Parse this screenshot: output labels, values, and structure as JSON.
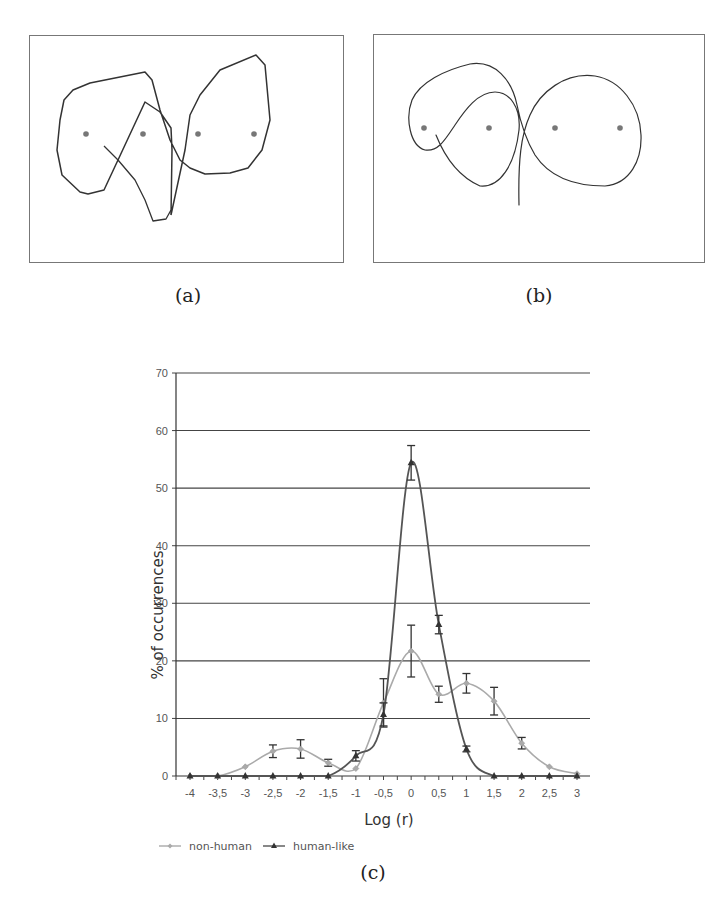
{
  "figure": {
    "panels": [
      {
        "id": "a",
        "caption": "(a)",
        "dots": [
          [
            86,
            134
          ],
          [
            143,
            134
          ],
          [
            198,
            134
          ],
          [
            254,
            134
          ]
        ]
      },
      {
        "id": "b",
        "caption": "(b)",
        "dots": [
          [
            424,
            128
          ],
          [
            489,
            128
          ],
          [
            555,
            128
          ],
          [
            620,
            128
          ]
        ]
      }
    ],
    "chart_caption": "(c)"
  },
  "chart_data": {
    "type": "line",
    "title": "",
    "xlabel": "Log (r)",
    "ylabel": "% of occurrences",
    "x": [
      -4,
      -3.5,
      -3,
      -2.5,
      -2,
      -1.5,
      -1,
      -0.5,
      0,
      0.5,
      1,
      1.5,
      2,
      2.5,
      3
    ],
    "x_tick_labels": [
      "-4",
      "-3,5",
      "-3",
      "-2,5",
      "-2",
      "-1,5",
      "-1",
      "-0,5",
      "0",
      "0,5",
      "1",
      "1,5",
      "2",
      "2,5",
      "3"
    ],
    "y_ticks": [
      0,
      10,
      20,
      30,
      40,
      50,
      60,
      70
    ],
    "ylim": [
      0,
      70
    ],
    "grid": "horizontal",
    "legend_position": "bottom-left",
    "series": [
      {
        "name": "non-human",
        "color": "#aaaaaa",
        "marker": "diamond",
        "values": [
          0,
          0,
          1.6,
          4.3,
          4.7,
          2.3,
          1.3,
          12.7,
          21.7,
          14.2,
          16.1,
          13.0,
          5.7,
          1.6,
          0.4
        ],
        "error": [
          0,
          0,
          0,
          1.1,
          1.6,
          0.6,
          0,
          4.2,
          4.5,
          1.4,
          1.7,
          2.4,
          1.0,
          0,
          0
        ]
      },
      {
        "name": "human-like",
        "color": "#555555",
        "marker": "triangle",
        "values": [
          0,
          0,
          0,
          0,
          0,
          0,
          3.5,
          10.7,
          54.4,
          26.3,
          4.7,
          0,
          0,
          0,
          0
        ],
        "error": [
          0,
          0,
          0,
          0,
          0,
          0,
          0.9,
          2.0,
          3.0,
          1.6,
          0.5,
          0,
          0,
          0,
          0
        ]
      }
    ]
  }
}
